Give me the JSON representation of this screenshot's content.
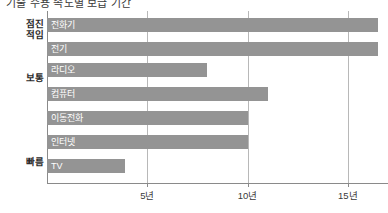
{
  "title": {
    "text": "기술 수용 속도별 보급 기간",
    "visible_clipped": true
  },
  "colors": {
    "bar": "#949494",
    "gridline": "#b8b8b8",
    "axis": "#8a8a8a",
    "bar_label_text": "#ffffff",
    "axis_label_text": "#3a3a3a",
    "group_label_text": "#2b2b2b",
    "background": "#ffffff"
  },
  "groups": [
    {
      "label": "점진\n적임",
      "top": 18
    },
    {
      "label": "보통",
      "top": 72
    },
    {
      "label": "빠름",
      "top": 156
    }
  ],
  "axis": {
    "ticks": [
      {
        "label": "5년",
        "value": 5
      },
      {
        "label": "10년",
        "value": 10
      },
      {
        "label": "15년",
        "value": 15
      }
    ],
    "min": 0,
    "max": 17
  },
  "chart_data": {
    "type": "bar",
    "orientation": "horizontal",
    "title": "기술 수용 속도별 보급 기간",
    "xlabel": "",
    "ylabel": "",
    "xlim": [
      0,
      17
    ],
    "grid": true,
    "legend": "none",
    "unit": "년",
    "categories": [
      "전화기",
      "전기",
      "라디오",
      "컴퓨터",
      "이동전화",
      "인터넷",
      "TV"
    ],
    "values": [
      16.5,
      16.5,
      8.0,
      11.0,
      10.0,
      10.0,
      3.9
    ],
    "groups": [
      "점진적임",
      "점진적임",
      "보통",
      "보통",
      "보통",
      "보통",
      "빠름"
    ],
    "bars": [
      {
        "label": "전화기",
        "value": 16.5,
        "clipped_at_edge": true,
        "group": "점진적임"
      },
      {
        "label": "전기",
        "value": 16.5,
        "clipped_at_edge": true,
        "group": "점진적임"
      },
      {
        "label": "라디오",
        "value": 8.0,
        "group": "보통"
      },
      {
        "label": "컴퓨터",
        "value": 11.0,
        "group": "보통"
      },
      {
        "label": "이동전화",
        "value": 10.0,
        "group": "보통"
      },
      {
        "label": "인터넷",
        "value": 10.0,
        "group": "보통"
      },
      {
        "label": "TV",
        "value": 3.9,
        "group": "빠름"
      }
    ]
  },
  "bar_layout": [
    {
      "top": 7,
      "value": 16.5
    },
    {
      "top": 31,
      "value": 16.5
    },
    {
      "top": 52,
      "value": 8.0
    },
    {
      "top": 76,
      "value": 11.0
    },
    {
      "top": 100,
      "value": 10.0
    },
    {
      "top": 124,
      "value": 10.0
    },
    {
      "top": 148,
      "value": 3.9
    }
  ]
}
